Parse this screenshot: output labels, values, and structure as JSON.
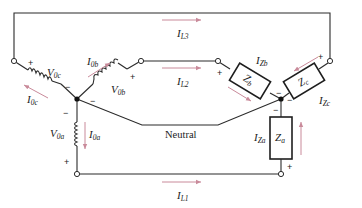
{
  "diagram": {
    "colors": {
      "wire": "#2b2b2b",
      "current_arrow": "#c98a9a",
      "background": "#ffffff"
    },
    "line_currents": [
      {
        "main": "I",
        "sub": "L3"
      },
      {
        "main": "I",
        "sub": "L2"
      },
      {
        "main": "I",
        "sub": "L1"
      }
    ],
    "source": {
      "voltages": [
        {
          "main": "V",
          "sub": "0c"
        },
        {
          "main": "V",
          "sub": "0b"
        },
        {
          "main": "V",
          "sub": "0a"
        }
      ],
      "currents": [
        {
          "main": "I",
          "sub": "0c"
        },
        {
          "main": "I",
          "sub": "0b"
        },
        {
          "main": "I",
          "sub": "0a"
        }
      ]
    },
    "load": {
      "impedances": [
        {
          "main": "Z",
          "sub": "b"
        },
        {
          "main": "Z",
          "sub": "c"
        },
        {
          "main": "Z",
          "sub": "a"
        }
      ],
      "currents": [
        {
          "main": "I",
          "sub": "Zb"
        },
        {
          "main": "I",
          "sub": "Zc"
        },
        {
          "main": "I",
          "sub": "Za"
        }
      ]
    },
    "neutral_label": "Neutral",
    "signs": {
      "plus": "+",
      "minus": "−"
    }
  }
}
